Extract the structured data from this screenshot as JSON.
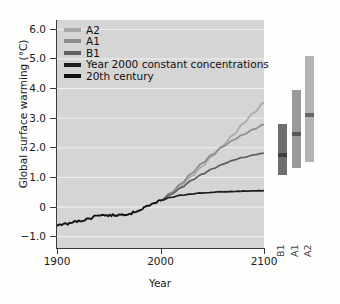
{
  "chart_data": {
    "type": "line",
    "title": "",
    "xlabel": "Year",
    "ylabel": "Global surface warming (°C)",
    "xlim": [
      1900,
      2100
    ],
    "ylim": [
      -1.4,
      6.3
    ],
    "xticks": [
      1900,
      2000,
      2100
    ],
    "xticklabels": [
      "1900",
      "2000",
      "2100"
    ],
    "yticks": [
      -1.0,
      0,
      1.0,
      2.0,
      3.0,
      4.0,
      5.0,
      6.0
    ],
    "yticklabels": [
      "−1.0",
      "0",
      "1.0",
      "2.0",
      "3.0",
      "4.0",
      "5.0",
      "6.0"
    ],
    "grid": true,
    "grid_color": "#f2f2f2",
    "panel_color": "#d5d5d5",
    "legend_position": "upper left",
    "series": [
      {
        "name": "A2",
        "color": "#a8a8a8",
        "x": [
          2000,
          2010,
          2020,
          2030,
          2040,
          2050,
          2060,
          2070,
          2080,
          2090,
          2100
        ],
        "values": [
          0.2,
          0.44,
          0.72,
          1.02,
          1.35,
          1.7,
          2.05,
          2.42,
          2.8,
          3.17,
          3.52
        ]
      },
      {
        "name": "A1",
        "color": "#8c8c8c",
        "x": [
          2000,
          2010,
          2020,
          2030,
          2040,
          2050,
          2060,
          2070,
          2080,
          2090,
          2100
        ],
        "values": [
          0.2,
          0.46,
          0.78,
          1.12,
          1.46,
          1.76,
          2.02,
          2.24,
          2.43,
          2.61,
          2.78
        ]
      },
      {
        "name": "B1",
        "color": "#5f5f5f",
        "x": [
          2000,
          2010,
          2020,
          2030,
          2040,
          2050,
          2060,
          2070,
          2080,
          2090,
          2100
        ],
        "values": [
          0.2,
          0.41,
          0.64,
          0.88,
          1.09,
          1.27,
          1.43,
          1.56,
          1.66,
          1.74,
          1.8
        ]
      },
      {
        "name": "Year 2000 constant concentrations",
        "color": "#1f1f1f",
        "x": [
          2000,
          2010,
          2020,
          2030,
          2040,
          2050,
          2060,
          2070,
          2080,
          2090,
          2100
        ],
        "values": [
          0.2,
          0.31,
          0.38,
          0.43,
          0.46,
          0.48,
          0.5,
          0.51,
          0.52,
          0.53,
          0.53
        ]
      },
      {
        "name": "20th century",
        "color": "#111111",
        "x": [
          1900,
          1910,
          1920,
          1930,
          1940,
          1950,
          1960,
          1970,
          1980,
          1990,
          2000
        ],
        "values": [
          -0.62,
          -0.58,
          -0.5,
          -0.42,
          -0.28,
          -0.3,
          -0.28,
          -0.24,
          -0.12,
          0.06,
          0.2
        ]
      }
    ],
    "uncertainty_bars": [
      {
        "label": "B1",
        "color": "#6e6e6e",
        "low": 1.05,
        "high": 2.8,
        "best": 1.75
      },
      {
        "label": "A1",
        "color": "#9a9a9a",
        "low": 1.3,
        "high": 3.95,
        "best": 2.45
      },
      {
        "label": "A2",
        "color": "#b4b4b4",
        "low": 1.5,
        "high": 5.1,
        "best": 3.1
      }
    ]
  },
  "legend": {
    "items": [
      {
        "label": "A2",
        "color": "#a8a8a8"
      },
      {
        "label": "A1",
        "color": "#8c8c8c"
      },
      {
        "label": "B1",
        "color": "#5f5f5f"
      },
      {
        "label": "Year 2000 constant concentrations",
        "color": "#1f1f1f"
      },
      {
        "label": "20th century",
        "color": "#111111"
      }
    ]
  }
}
